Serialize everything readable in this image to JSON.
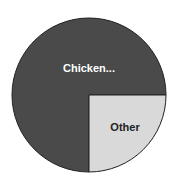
{
  "chart_data": {
    "type": "pie",
    "title": "",
    "categories": [
      "Chicken...",
      "Other"
    ],
    "values": [
      75,
      25
    ],
    "colors": [
      "#4a4a4a",
      "#d9d9d9"
    ],
    "label_colors": [
      "#ffffff",
      "#222222"
    ],
    "start_angle_deg": 90,
    "direction": "clockwise_from_3_oclock_other",
    "legend": "none",
    "data_labels": [
      "Chicken...",
      "Other"
    ]
  },
  "geometry": {
    "cx": 89,
    "cy": 95,
    "r": 77
  }
}
